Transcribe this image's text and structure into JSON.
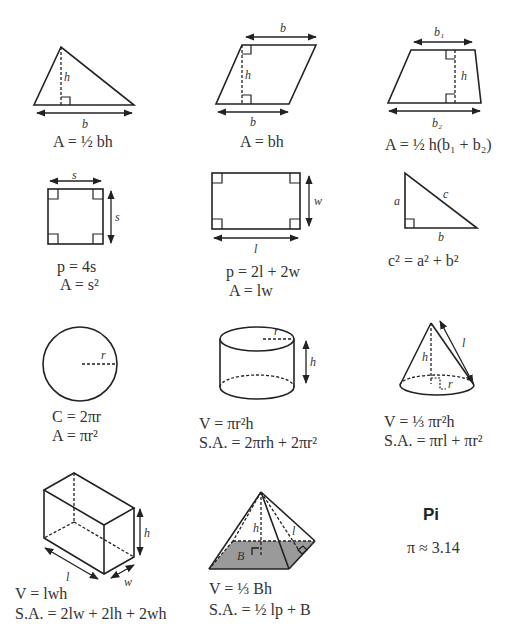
{
  "sheet": {
    "cells": [
      {
        "shape": "triangle",
        "labels": {
          "height": "h",
          "base": "b"
        },
        "formula_lines": [
          "A = ½ bh"
        ]
      },
      {
        "shape": "parallelogram",
        "labels": {
          "top": "b",
          "height": "h",
          "base": "b"
        },
        "formula_lines": [
          "A = bh"
        ]
      },
      {
        "shape": "trapezoid",
        "labels": {
          "top": "b₁",
          "height": "h",
          "base": "b₂"
        },
        "formula_lines": [
          "A = ½ h(b₁ + b₂)"
        ]
      },
      {
        "shape": "square",
        "labels": {
          "top": "s",
          "side": "s"
        },
        "formula_lines": [
          "p = 4s",
          "A = s²"
        ]
      },
      {
        "shape": "rectangle",
        "labels": {
          "width": "w",
          "length": "l"
        },
        "formula_lines": [
          "p = 2l + 2w",
          "A = lw"
        ]
      },
      {
        "shape": "right-triangle",
        "labels": {
          "a": "a",
          "b": "b",
          "c": "c"
        },
        "formula_lines": [
          "c² = a² + b²"
        ]
      },
      {
        "shape": "circle",
        "labels": {
          "radius": "r"
        },
        "formula_lines": [
          "C = 2πr",
          "A = πr²"
        ]
      },
      {
        "shape": "cylinder",
        "labels": {
          "radius": "r",
          "height": "h"
        },
        "formula_lines": [
          "V = πr²h",
          "S.A. = 2πrh + 2πr²"
        ]
      },
      {
        "shape": "cone",
        "labels": {
          "height": "h",
          "slant": "l",
          "radius": "r"
        },
        "formula_lines": [
          "V = ⅓ πr²h",
          "S.A. = πrl + πr²"
        ]
      },
      {
        "shape": "rectangular-prism",
        "labels": {
          "height": "h",
          "length": "l",
          "width": "w"
        },
        "formula_lines": [
          "V = lwh",
          "S.A. = 2lw + 2lh + 2wh"
        ]
      },
      {
        "shape": "pyramid",
        "labels": {
          "height": "h",
          "slant": "l",
          "base": "B"
        },
        "formula_lines": [
          "V = ⅓ Bh",
          "S.A. = ½ lp + B"
        ]
      },
      {
        "shape": "pi",
        "title": "Pi",
        "formula_lines": [
          "π ≈ 3.14"
        ]
      }
    ],
    "frac": {
      "half_num": "1",
      "half_den": "2",
      "third_num": "1",
      "third_den": "3"
    },
    "colors": {
      "stroke": "#222222",
      "pyramid_base_fill": "#9a9a9a",
      "text": "#333333"
    }
  }
}
